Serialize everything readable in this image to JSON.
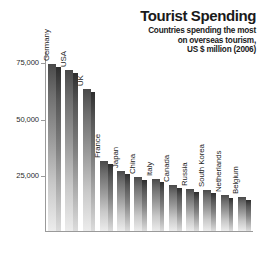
{
  "chart_data": {
    "type": "bar",
    "title": "Tourist Spending",
    "subtitle_lines": [
      "Countries spending the most",
      "on overseas tourism,",
      "US $ million (2006)"
    ],
    "xlabel": "",
    "ylabel": "",
    "ylim": [
      0,
      80000
    ],
    "grid": false,
    "legend": "none",
    "orientation": "vertical",
    "ytick_labels": [
      "75,000",
      "50,000",
      "25,000"
    ],
    "ytick_values": [
      75000,
      50000,
      25000
    ],
    "categories": [
      "Germany",
      "USA",
      "UK",
      "France",
      "Japan",
      "China",
      "Italy",
      "Canada",
      "Russia",
      "South Korea",
      "Netherlands",
      "Belgium"
    ],
    "values": [
      74800,
      72000,
      63300,
      31200,
      26900,
      24300,
      23100,
      20500,
      18800,
      18200,
      16200,
      15100
    ]
  },
  "style": {
    "bar_light": "#ececec",
    "bar_dark": "#4a4a4a",
    "axis_color": "#9a9a9a",
    "text_color": "#1a1a1a"
  }
}
